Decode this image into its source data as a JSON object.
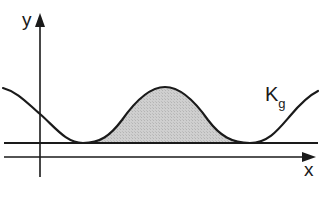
{
  "diagram": {
    "y_axis_label": "y",
    "x_axis_label": "x",
    "curve_label": {
      "main": "K",
      "subscript": "g"
    },
    "colors": {
      "line": "#1a1a1a",
      "shaded_fill": "#c8c8c8"
    },
    "elements": [
      "vertical y-axis with arrow",
      "horizontal x-axis with arrow",
      "horizontal baseline above x-axis",
      "smooth periodic curve K_g with two minima touching baseline and one peak",
      "grey shaded area under the peak between the two minima"
    ]
  }
}
